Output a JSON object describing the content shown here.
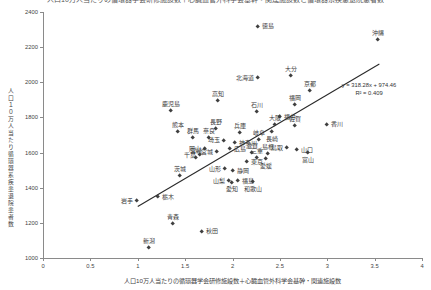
{
  "clipped_title": "人口10万人当たりの循環器学会研修施設数＋心臓血管外科学会基幹・関連施設数と循環器系疾患退院患者数",
  "chart_data": {
    "type": "scatter",
    "title": "",
    "xlabel": "人口10万人当たりの循環器学会研修施設数＋心臓血管外科学会基幹・関連施設数",
    "ylabel": "人口１０万人当たり循環器系疾患退院患者数",
    "xlim": [
      0,
      4
    ],
    "ylim": [
      1000,
      2400
    ],
    "x_ticks": [
      "0",
      "0.5",
      "1",
      "1.5",
      "2",
      "2.5",
      "3",
      "3.5",
      "4"
    ],
    "y_ticks": [
      "1000",
      "1200",
      "1400",
      "1600",
      "1800",
      "2000",
      "2200",
      "2400"
    ],
    "grid": false,
    "legend": "none",
    "marker_color": "#3f3f3f",
    "trendline": {
      "equation": "y = 318.28x + 974.46",
      "r_squared": "R² = 0.409",
      "slope": 318.28,
      "intercept": 974.46,
      "x_start": 1.0,
      "x_end": 3.55,
      "color": "#2a2a2a"
    },
    "points": [
      {
        "label": "徳島",
        "x": 2.27,
        "y": 2315,
        "label_pos": "right"
      },
      {
        "label": "沖縄",
        "x": 3.54,
        "y": 2240,
        "label_pos": "above"
      },
      {
        "label": "大分",
        "x": 2.62,
        "y": 2035,
        "label_pos": "above"
      },
      {
        "label": "北海道",
        "x": 2.27,
        "y": 2024,
        "label_pos": "left"
      },
      {
        "label": "京都",
        "x": 2.82,
        "y": 1950,
        "label_pos": "above"
      },
      {
        "label": "高知",
        "x": 1.85,
        "y": 1893,
        "label_pos": "above"
      },
      {
        "label": "福岡",
        "x": 2.66,
        "y": 1868,
        "label_pos": "above"
      },
      {
        "label": "鹿児島",
        "x": 1.35,
        "y": 1836,
        "label_pos": "above"
      },
      {
        "label": "石川",
        "x": 2.26,
        "y": 1831,
        "label_pos": "above"
      },
      {
        "label": "福井",
        "x": 2.5,
        "y": 1802,
        "label_pos": "right"
      },
      {
        "label": "香川",
        "x": 3.0,
        "y": 1757,
        "label_pos": "right"
      },
      {
        "label": "大阪",
        "x": 2.45,
        "y": 1757,
        "label_pos": "above"
      },
      {
        "label": "佐賀",
        "x": 2.66,
        "y": 1751,
        "label_pos": "above"
      },
      {
        "label": "長野",
        "x": 1.83,
        "y": 1734,
        "label_pos": "above"
      },
      {
        "label": "熊本",
        "x": 1.42,
        "y": 1717,
        "label_pos": "above"
      },
      {
        "label": "長崎",
        "x": 2.42,
        "y": 1717,
        "label_pos": "below"
      },
      {
        "label": "兵庫",
        "x": 2.08,
        "y": 1711,
        "label_pos": "above"
      },
      {
        "label": "群馬",
        "x": 1.58,
        "y": 1683,
        "label_pos": "above"
      },
      {
        "label": "奈良",
        "x": 1.75,
        "y": 1683,
        "label_pos": "above"
      },
      {
        "label": "岐阜",
        "x": 2.28,
        "y": 1671,
        "label_pos": "above"
      },
      {
        "label": "埼玉",
        "x": 1.91,
        "y": 1666,
        "label_pos": "left"
      },
      {
        "label": "神奈川",
        "x": 2.03,
        "y": 1654,
        "label_pos": "right"
      },
      {
        "label": "鳥取",
        "x": 2.58,
        "y": 1626,
        "label_pos": "left"
      },
      {
        "label": "岡山",
        "x": 1.71,
        "y": 1620,
        "label_pos": "left"
      },
      {
        "label": "広島",
        "x": 1.97,
        "y": 1620,
        "label_pos": "right"
      },
      {
        "label": "山口",
        "x": 2.68,
        "y": 1614,
        "label_pos": "right"
      },
      {
        "label": "宮城",
        "x": 1.84,
        "y": 1603,
        "label_pos": "left"
      },
      {
        "label": "滋賀",
        "x": 2.21,
        "y": 1597,
        "label_pos": "above"
      },
      {
        "label": "富山",
        "x": 2.8,
        "y": 1597,
        "label_pos": "below"
      },
      {
        "label": "島根",
        "x": 2.37,
        "y": 1592,
        "label_pos": "above"
      },
      {
        "label": "千葉",
        "x": 1.66,
        "y": 1586,
        "label_pos": "left"
      },
      {
        "label": "三重",
        "x": 2.26,
        "y": 1569,
        "label_pos": "above"
      },
      {
        "label": "宮崎",
        "x": 1.61,
        "y": 1569,
        "label_pos": "above"
      },
      {
        "label": "愛媛",
        "x": 2.35,
        "y": 1563,
        "label_pos": "below"
      },
      {
        "label": "東京",
        "x": 2.15,
        "y": 1546,
        "label_pos": "right"
      },
      {
        "label": "山形",
        "x": 1.92,
        "y": 1506,
        "label_pos": "left"
      },
      {
        "label": "静岡",
        "x": 2.01,
        "y": 1495,
        "label_pos": "right"
      },
      {
        "label": "茨城",
        "x": 1.45,
        "y": 1467,
        "label_pos": "above"
      },
      {
        "label": "山梨",
        "x": 1.96,
        "y": 1438,
        "label_pos": "left"
      },
      {
        "label": "福島",
        "x": 2.06,
        "y": 1438,
        "label_pos": "right"
      },
      {
        "label": "和歌山",
        "x": 2.22,
        "y": 1432,
        "label_pos": "below"
      },
      {
        "label": "愛知",
        "x": 1.99,
        "y": 1427,
        "label_pos": "below"
      },
      {
        "label": "栃木",
        "x": 1.21,
        "y": 1347,
        "label_pos": "right"
      },
      {
        "label": "岩手",
        "x": 0.99,
        "y": 1324,
        "label_pos": "left"
      },
      {
        "label": "青森",
        "x": 1.37,
        "y": 1193,
        "label_pos": "above"
      },
      {
        "label": "秋田",
        "x": 1.68,
        "y": 1148,
        "label_pos": "right"
      },
      {
        "label": "新潟",
        "x": 1.12,
        "y": 1057,
        "label_pos": "above"
      }
    ]
  }
}
